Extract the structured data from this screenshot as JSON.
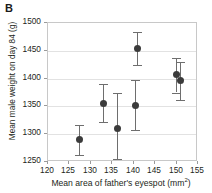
{
  "panel": {
    "label": "B"
  },
  "axes": {
    "ylabel": "Mean male weight on day 84 (g)",
    "xlabel_main": "Mean area of father's eyespot (mm",
    "xlabel_sup": "2",
    "xlabel_close": ")",
    "xlabel_full": "Mean area of father's eyespot (mm²)"
  },
  "chart_data": {
    "type": "scatter",
    "title": "B",
    "xlabel": "Mean area of father's eyespot (mm²)",
    "ylabel": "Mean male weight on day 84 (g)",
    "xlim": [
      120,
      155
    ],
    "ylim": [
      1250,
      1500
    ],
    "xticks": [
      120,
      125,
      130,
      135,
      140,
      145,
      150,
      155
    ],
    "yticks": [
      1250,
      1300,
      1350,
      1400,
      1450,
      1500
    ],
    "grid": "horizontal",
    "legend": "none",
    "marker_color": "#3b3b3b",
    "errorbar_color": "#6e6e6e",
    "points": [
      {
        "x": 127.3,
        "y": 1290,
        "y_low": 1263,
        "y_high": 1316
      },
      {
        "x": 133.0,
        "y": 1355,
        "y_low": 1322,
        "y_high": 1391
      },
      {
        "x": 136.3,
        "y": 1311,
        "y_low": 1255,
        "y_high": 1374
      },
      {
        "x": 140.3,
        "y": 1352,
        "y_low": 1307,
        "y_high": 1397
      },
      {
        "x": 140.8,
        "y": 1455,
        "y_low": 1424,
        "y_high": 1484
      },
      {
        "x": 150.0,
        "y": 1407,
        "y_low": 1375,
        "y_high": 1437
      },
      {
        "x": 151.0,
        "y": 1397,
        "y_low": 1362,
        "y_high": 1430
      }
    ]
  }
}
